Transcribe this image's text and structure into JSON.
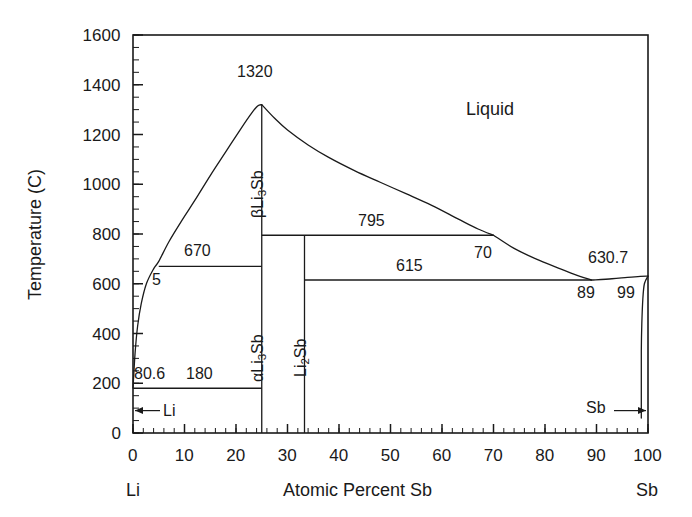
{
  "chart_data": {
    "type": "line",
    "title": "",
    "subtitle": "",
    "xlabel": "Atomic Percent Sb",
    "ylabel": "Temperature (C)",
    "xlim": [
      0,
      100
    ],
    "ylim": [
      0,
      1600
    ],
    "x_ticks": [
      "0",
      "10",
      "20",
      "30",
      "40",
      "50",
      "60",
      "70",
      "80",
      "90",
      "100"
    ],
    "x_tick_values": [
      0,
      10,
      20,
      30,
      40,
      50,
      60,
      70,
      80,
      90,
      100
    ],
    "y_ticks": [
      "0",
      "200",
      "400",
      "600",
      "800",
      "1000",
      "1200",
      "1400",
      "1600"
    ],
    "y_tick_values": [
      0,
      200,
      400,
      600,
      800,
      1000,
      1200,
      1400,
      1600
    ],
    "x_minor_step": 2,
    "y_minor_step": 50,
    "grid": false,
    "legend": "none",
    "axis_left_label": "Li",
    "axis_right_label": "Sb",
    "series": [
      {
        "name": "Li-rich liquidus",
        "comment": "from Li melting point 180.6 C rising to congruent melting of Li3Sb",
        "points": [
          [
            0,
            180.6
          ],
          [
            0.4,
            320
          ],
          [
            0.9,
            430
          ],
          [
            1.6,
            520
          ],
          [
            2.6,
            600
          ],
          [
            4.0,
            660
          ],
          [
            5.0,
            690
          ],
          [
            7.0,
            770
          ],
          [
            9.5,
            855
          ],
          [
            12.0,
            935
          ],
          [
            15.0,
            1035
          ],
          [
            18.0,
            1130
          ],
          [
            21.0,
            1225
          ],
          [
            23.0,
            1285
          ],
          [
            24.2,
            1315
          ],
          [
            25.0,
            1320
          ]
        ]
      },
      {
        "name": "Sb-side liquidus from Li3Sb maximum",
        "points": [
          [
            25.0,
            1320
          ],
          [
            27.5,
            1265
          ],
          [
            30.0,
            1218
          ],
          [
            34.0,
            1158
          ],
          [
            38.0,
            1108
          ],
          [
            43.0,
            1055
          ],
          [
            48.0,
            1008
          ],
          [
            53.0,
            962
          ],
          [
            58.0,
            915
          ],
          [
            63.0,
            862
          ],
          [
            67.0,
            820
          ],
          [
            70.0,
            795
          ]
        ]
      },
      {
        "name": "Liquidus 70 to eutectic 89",
        "points": [
          [
            70.0,
            795
          ],
          [
            74.0,
            742
          ],
          [
            78.0,
            702
          ],
          [
            83.0,
            660
          ],
          [
            86.5,
            632
          ],
          [
            89.0,
            615
          ]
        ]
      },
      {
        "name": "Sb-rich liquidus to Sb melting point",
        "points": [
          [
            89.0,
            615
          ],
          [
            93.0,
            620
          ],
          [
            96.0,
            626
          ],
          [
            98.5,
            630
          ],
          [
            100.0,
            630.7
          ]
        ]
      },
      {
        "name": "Sb-rich solidus",
        "points": [
          [
            100.0,
            630.7
          ],
          [
            99.3,
            600
          ],
          [
            99.0,
            540
          ],
          [
            98.8,
            440
          ],
          [
            98.7,
            330
          ],
          [
            98.7,
            200
          ],
          [
            98.7,
            60
          ]
        ]
      }
    ],
    "horizontal_invariants": [
      {
        "label": "795",
        "temperature": 795,
        "x_start": 25.0,
        "x_end": 70.0
      },
      {
        "label": "670",
        "temperature": 670,
        "x_start": 5.0,
        "x_end": 25.0
      },
      {
        "label": "615",
        "temperature": 615,
        "x_start": 33.3,
        "x_end": 89.0
      },
      {
        "label": "180",
        "temperature": 180,
        "x_start": 0.0,
        "x_end": 25.0
      }
    ],
    "vertical_compound_lines": [
      {
        "label": "Li3Sb",
        "x": 25.0,
        "y_top": 1320,
        "y_bottom": 0
      },
      {
        "label": "Li2Sb",
        "x": 33.3,
        "y_top": 795,
        "y_bottom": 0
      }
    ],
    "annotations": [
      {
        "text": "1320",
        "x": 25.0,
        "y": 1320,
        "role": "congruent-melting-temperature"
      },
      {
        "text": "795",
        "x": 44.0,
        "y": 795,
        "role": "peritectic-temperature"
      },
      {
        "text": "670",
        "x": 14.0,
        "y": 670,
        "role": "eutectic-temperature"
      },
      {
        "text": "615",
        "x": 62.0,
        "y": 615,
        "role": "eutectic-temperature"
      },
      {
        "text": "630.7",
        "x": 95.0,
        "y": 645,
        "role": "sb-melting-point"
      },
      {
        "text": "180",
        "x": 14.0,
        "y": 210,
        "role": "eutectic-temperature"
      },
      {
        "text": "80.6",
        "x": 1.0,
        "y": 210,
        "role": "li-melting-point-decimal"
      },
      {
        "text": "5",
        "x": 5.0,
        "y": 640,
        "role": "composition"
      },
      {
        "text": "70",
        "x": 70.0,
        "y": 760,
        "role": "composition"
      },
      {
        "text": "89",
        "x": 89.0,
        "y": 585,
        "role": "composition"
      },
      {
        "text": "99",
        "x": 96.5,
        "y": 585,
        "role": "composition"
      }
    ],
    "phase_regions": [
      {
        "label": "Liquid",
        "x": 65,
        "y": 1370
      },
      {
        "label": "βLi3Sb",
        "x": 25,
        "y": 1020,
        "orientation": "vertical"
      },
      {
        "label": "αLi3Sb",
        "x": 25,
        "y": 380,
        "orientation": "vertical"
      },
      {
        "label": "Li2Sb",
        "x": 33.3,
        "y": 380,
        "orientation": "vertical"
      }
    ],
    "terminal_markers": [
      {
        "label": "Li",
        "side": "left",
        "temperature": 90
      },
      {
        "label": "Sb",
        "side": "right",
        "temperature": 90
      }
    ]
  },
  "axis": {
    "y_title": "Temperature (C)",
    "x_title": "Atomic Percent Sb",
    "left_endpoint": "Li",
    "right_endpoint": "Sb"
  },
  "ticks": {
    "x": [
      "0",
      "10",
      "20",
      "30",
      "40",
      "50",
      "60",
      "70",
      "80",
      "90",
      "100"
    ],
    "y": [
      "0",
      "200",
      "400",
      "600",
      "800",
      "1000",
      "1200",
      "1400",
      "1600"
    ]
  },
  "labels": {
    "liquid": "Liquid",
    "beta_li3sb_pre": "βLi",
    "beta_li3sb_sub": "3",
    "beta_li3sb_post": "Sb",
    "alpha_li3sb_pre": "αLi",
    "alpha_li3sb_sub": "3",
    "alpha_li3sb_post": "Sb",
    "li2sb_pre": "Li",
    "li2sb_sub": "2",
    "li2sb_post": "Sb",
    "t1320": "1320",
    "t795": "795",
    "t670": "670",
    "t615": "615",
    "t630_7": "630.7",
    "t180": "180",
    "c80_6": "80.6",
    "c5": "5",
    "c70": "70",
    "c89": "89",
    "c99": "99",
    "li_arrow": "Li",
    "sb_arrow": "Sb"
  },
  "colors": {
    "line": "#1a1a1a",
    "text": "#1a1a1a",
    "background": "#ffffff"
  }
}
